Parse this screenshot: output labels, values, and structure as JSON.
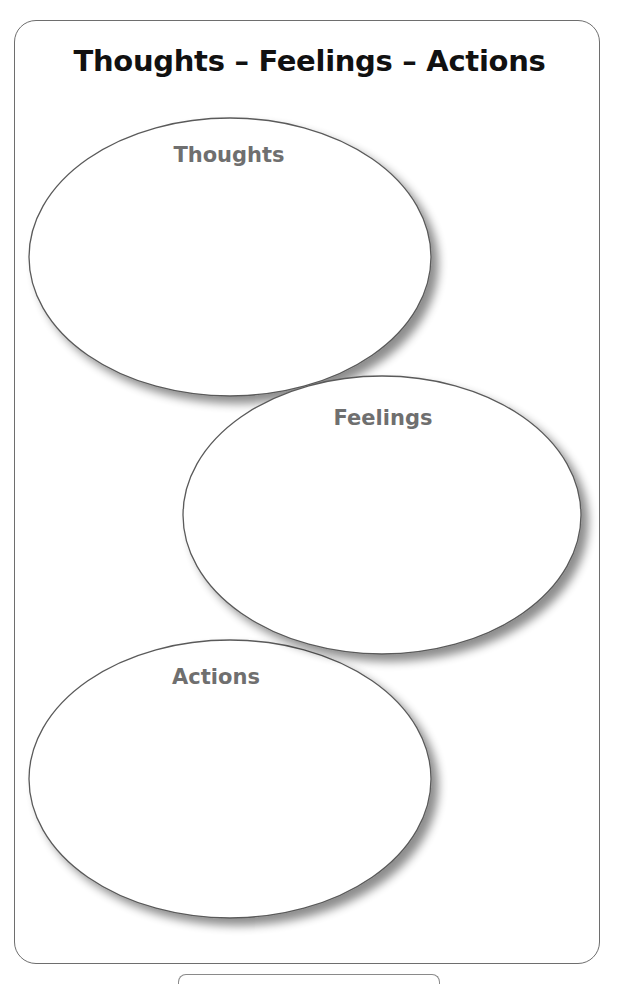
{
  "page": {
    "title": "Thoughts – Feelings – Actions"
  },
  "ovals": [
    {
      "id": "thoughts",
      "label": "Thoughts",
      "cx": 230,
      "cy": 257,
      "rx": 201,
      "ry": 139,
      "label_x": 229,
      "label_y": 143
    },
    {
      "id": "feelings",
      "label": "Feelings",
      "cx": 382,
      "cy": 515,
      "rx": 199,
      "ry": 139,
      "label_x": 383,
      "label_y": 406
    },
    {
      "id": "actions",
      "label": "Actions",
      "cx": 230,
      "cy": 779,
      "rx": 201,
      "ry": 139,
      "label_x": 216,
      "label_y": 665
    }
  ],
  "colors": {
    "frame_border": "#6e6e6e",
    "oval_stroke": "#5a5a5a",
    "label_text": "#6f6f6f",
    "title_text": "#111111",
    "shadow": "#9a9a9a"
  }
}
